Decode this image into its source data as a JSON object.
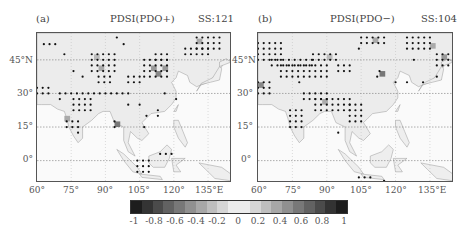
{
  "figure": {
    "panels": [
      {
        "label": "(a)",
        "title": "PDSI(PDO+)",
        "ss": "SS:121",
        "y_ticks": [
          "45°N",
          "30°",
          "15°",
          "0°"
        ],
        "x_ticks": [
          "60°",
          "75°",
          "90°",
          "105°",
          "120°",
          "135°E"
        ]
      },
      {
        "label": "(b)",
        "title": "PDSI(PDO−)",
        "ss": "SS:104",
        "y_ticks": [
          "45°N",
          "30°",
          "15°",
          "0°"
        ],
        "x_ticks": [
          "60°",
          "75°",
          "90°",
          "105°",
          "120°",
          "135°E"
        ]
      }
    ],
    "colorbar": {
      "labels": [
        "-1",
        "-0.8",
        "-0.6",
        "-0.4",
        "-0.2",
        "0",
        "0.2",
        "0.4",
        "0.6",
        "0.8",
        "1"
      ],
      "range": [
        -1,
        1
      ],
      "low_color": "#111111",
      "mid_color": "#f7f7f7",
      "high_color": "#111111"
    },
    "map_extent": {
      "lon": [
        60,
        145
      ],
      "lat": [
        -10,
        57
      ]
    },
    "stipple_note": "Dots mark statistically significant grid cells",
    "significant_counts": {
      "panel_a": 121,
      "panel_b": 104
    }
  }
}
